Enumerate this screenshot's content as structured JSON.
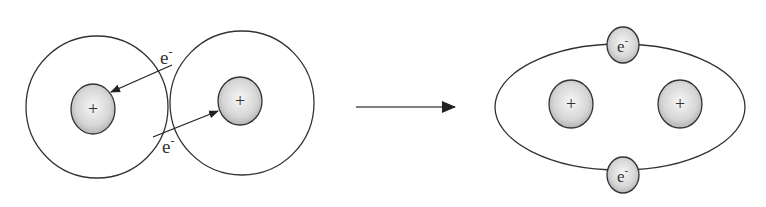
{
  "diagram": {
    "before": {
      "atoms": [
        {
          "nucleus_label": "+",
          "electron_label": "e",
          "electron_charge": "-"
        },
        {
          "nucleus_label": "+",
          "electron_label": "e",
          "electron_charge": "-"
        }
      ]
    },
    "transition_arrow": "reaction-arrow",
    "after": {
      "nuclei": [
        {
          "label": "+"
        },
        {
          "label": "+"
        }
      ],
      "shared_electrons": [
        {
          "label": "e",
          "charge": "-"
        },
        {
          "label": "e",
          "charge": "-"
        }
      ]
    },
    "colors": {
      "stroke": "#333333",
      "nucleus_fill_center": "#f4f4f4",
      "nucleus_fill_edge": "#b8b8b8",
      "background": "#ffffff"
    }
  }
}
